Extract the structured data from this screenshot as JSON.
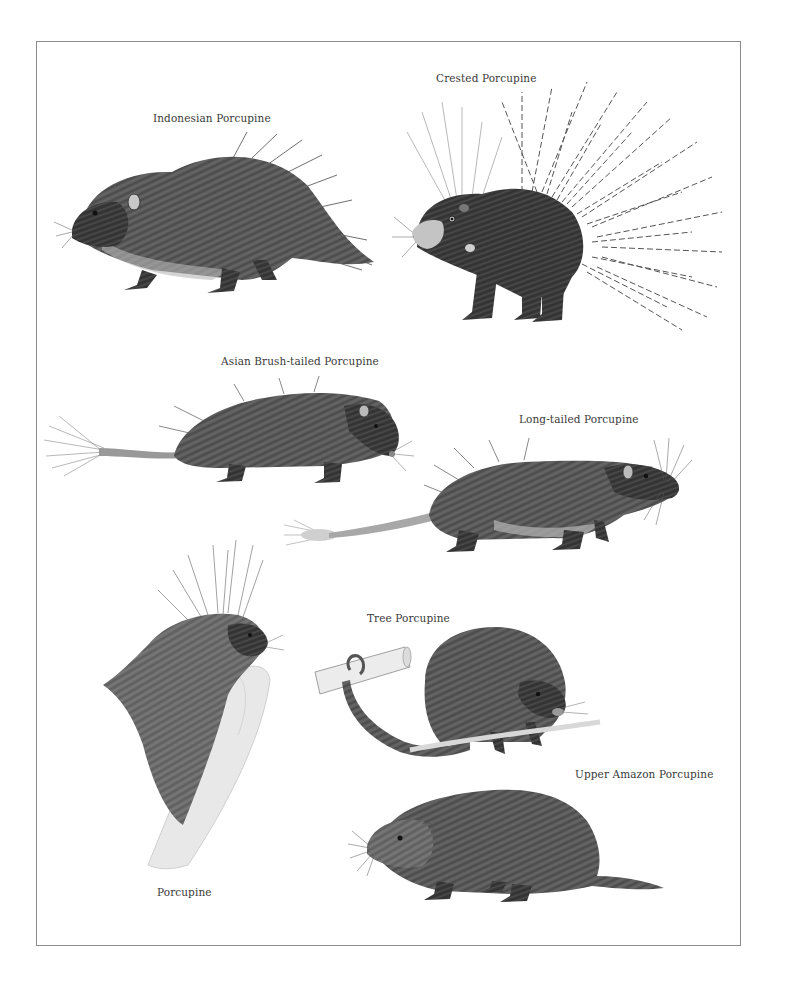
{
  "plate": {
    "frame_color": "#8a8a8a",
    "ink_color": "#3a3a3a",
    "species": [
      {
        "id": "indonesian",
        "label": "Indonesian Porcupine",
        "icon": "indonesian-porcupine-illustration"
      },
      {
        "id": "crested",
        "label": "Crested Porcupine",
        "icon": "crested-porcupine-illustration"
      },
      {
        "id": "asian_brush_tailed",
        "label": "Asian Brush-tailed Porcupine",
        "icon": "asian-brush-tailed-porcupine-illustration"
      },
      {
        "id": "long_tailed",
        "label": "Long-tailed Porcupine",
        "icon": "long-tailed-porcupine-illustration"
      },
      {
        "id": "tree",
        "label": "Tree Porcupine",
        "icon": "tree-porcupine-illustration"
      },
      {
        "id": "upper_amazon",
        "label": "Upper Amazon Porcupine",
        "icon": "upper-amazon-porcupine-illustration"
      },
      {
        "id": "porcupine",
        "label": "Porcupine",
        "icon": "north-american-porcupine-illustration"
      }
    ]
  }
}
